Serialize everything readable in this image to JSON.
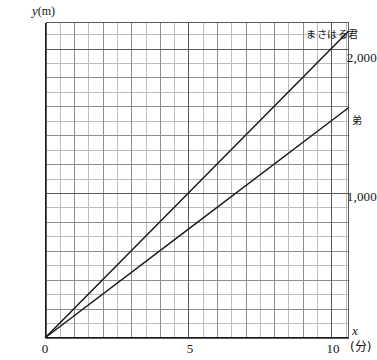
{
  "chart_data": {
    "type": "line",
    "title": "",
    "subtitle": "",
    "xlabel": "x",
    "x_unit": "(分)",
    "ylabel": "y",
    "y_unit": "(m)",
    "xlim": [
      0,
      10.6
    ],
    "ylim": [
      0,
      2180
    ],
    "grid": true,
    "grid_major_x": [
      0,
      5,
      10
    ],
    "grid_major_y": [
      0,
      1000,
      2000
    ],
    "grid_minor_x_step": 0.5,
    "grid_minor_y_step": 100,
    "xticks": [
      "0",
      "5",
      "10"
    ],
    "xtick_values": [
      0,
      5,
      10
    ],
    "yticks": [
      "1,000",
      "2,000"
    ],
    "ytick_values": [
      1000,
      2000
    ],
    "legend_position": "inline-right-of-line-end",
    "series": [
      {
        "name": "まさはる君",
        "slope": 200,
        "x": [
          0,
          5,
          10,
          10.6
        ],
        "values": [
          0,
          1000,
          2000,
          2120
        ]
      },
      {
        "name": "弟",
        "slope": 150,
        "x": [
          0,
          5,
          10,
          10.6
        ],
        "values": [
          0,
          750,
          1500,
          1590
        ]
      }
    ],
    "colors": {
      "line": "#1a1a1a",
      "axis": "#1a1a1a",
      "grid_major": "#5a5a5a",
      "grid_minor": "#bdbdbd",
      "background": "#ffffff"
    }
  },
  "axes": {
    "y_label_text": "y",
    "y_unit_text": "(m)",
    "x_label_text": "x",
    "x_unit_text": "(分)"
  },
  "ticks": {
    "y": {
      "t2000": "2,000",
      "t1000": "1,000"
    },
    "x": {
      "t0": "0",
      "t5": "5",
      "t10": "10"
    }
  },
  "labels": {
    "series0": "まさはる君",
    "series1": "弟"
  }
}
